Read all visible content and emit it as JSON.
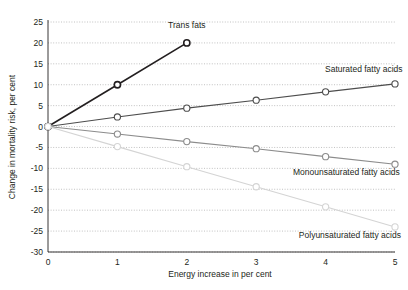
{
  "chart_data": {
    "type": "line",
    "title": "",
    "subtitle": "",
    "xlabel": "Energy increase in per cent",
    "ylabel": "Change in mortality risk, per cent",
    "x": [
      0,
      1,
      2,
      3,
      4,
      5
    ],
    "xticklabels": [
      "0",
      "1",
      "2",
      "3",
      "4",
      "5"
    ],
    "yticklabels": [
      "25",
      "20",
      "15",
      "10",
      "5",
      "0",
      "-5",
      "-10",
      "-15",
      "-20",
      "-25",
      "-30"
    ],
    "ytickvalues": [
      25,
      20,
      15,
      10,
      5,
      0,
      -5,
      -10,
      -15,
      -20,
      -25,
      -30
    ],
    "xlim": [
      0,
      5
    ],
    "ylim": [
      -30,
      25
    ],
    "grid": "horizontal-dotted",
    "legend": "inline-annotations",
    "series": [
      {
        "name": "Trans fats",
        "color": "#231f20",
        "width": 1.6,
        "x": [
          0,
          1,
          2
        ],
        "values": [
          0,
          10,
          20
        ],
        "label_x": 2,
        "label_y": 23.5,
        "label_anchor": "middle"
      },
      {
        "name": "Saturated fatty acids",
        "color": "#4d4d4d",
        "width": 1.1,
        "x": [
          0,
          1,
          2,
          3,
          4,
          5
        ],
        "values": [
          0,
          2.3,
          4.4,
          6.3,
          8.3,
          10.2
        ],
        "label_x": 4.55,
        "label_y": 13.0,
        "label_anchor": "middle"
      },
      {
        "name": "Monounsaturated fatty acids",
        "color": "#8c8c8c",
        "width": 1.1,
        "x": [
          0,
          1,
          2,
          3,
          4,
          5
        ],
        "values": [
          0,
          -1.8,
          -3.6,
          -5.3,
          -7.2,
          -9.0
        ],
        "label_x": 4.3,
        "label_y": -11.6,
        "label_anchor": "middle"
      },
      {
        "name": "Polyunsaturated fatty acids",
        "color": "#d4d4d4",
        "width": 1.1,
        "x": [
          0,
          1,
          2,
          3,
          4,
          5
        ],
        "values": [
          0,
          -4.8,
          -9.6,
          -14.4,
          -19.2,
          -24.0
        ],
        "label_x": 4.35,
        "label_y": -26.6,
        "label_anchor": "middle"
      }
    ],
    "colors": {
      "axis": "#231f20",
      "grid": "#b3b3b3",
      "background": "#ffffff",
      "marker_fill": "#ffffff"
    }
  }
}
